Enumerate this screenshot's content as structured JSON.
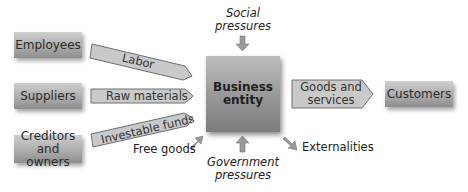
{
  "diagram": {
    "inputs": [
      {
        "source": "Employees",
        "flow": "Labor"
      },
      {
        "source": "Suppliers",
        "flow": "Raw materials"
      },
      {
        "source": "Creditors and owners",
        "flow": "Investable funds"
      }
    ],
    "center": {
      "label_line1": "Business",
      "label_line2": "entity"
    },
    "output": {
      "flow_line1": "Goods and",
      "flow_line2": "services",
      "target": "Customers"
    },
    "top_influence": {
      "line1": "Social",
      "line2": "pressures"
    },
    "bottom_influence": {
      "line1": "Government",
      "line2": "pressures"
    },
    "free_input": "Free goods",
    "side_output": "Externalities",
    "colors": {
      "box_light": "#cfcfcf",
      "box_dark": "#8e8e8e",
      "arrow_fill": "#c6c6c6",
      "arrow_stroke": "#6e6e6e"
    }
  },
  "boxes": {
    "employees": "Employees",
    "suppliers": "Suppliers",
    "creditors_line1": "Creditors and",
    "creditors_line2": "owners",
    "customers": "Customers"
  }
}
